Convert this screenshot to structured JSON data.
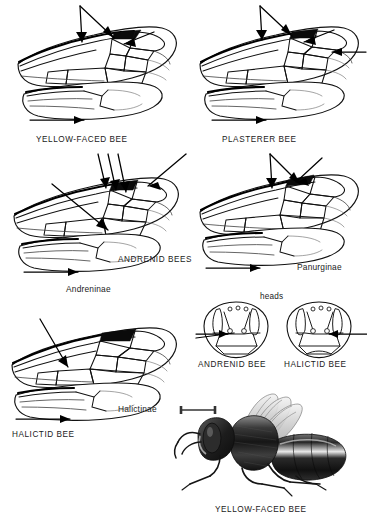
{
  "plate": {
    "title_caption": "YELLOW-FACED BEE",
    "background_color": "#ffffff",
    "ink_color": "#111111",
    "figure_type": "entomological-plate-bee-wing-venation"
  },
  "panels": [
    {
      "id": "yellow-faced-bee",
      "label": "YELLOW-FACED BEE",
      "label_style": "caps",
      "position": "top-left",
      "wings": [
        "forewing",
        "hindwing"
      ],
      "arrows": 3
    },
    {
      "id": "plasterer-bee",
      "label": "PLASTERER BEE",
      "label_style": "caps",
      "position": "top-right",
      "wings": [
        "forewing",
        "hindwing"
      ],
      "arrows": 4
    },
    {
      "id": "andrenid-bees-andreninae",
      "label": "ANDRENID BEES",
      "sublabel": "Andreninae",
      "label_style": "caps",
      "sublabel_style": "italic",
      "position": "middle-left",
      "wings": [
        "forewing",
        "hindwing"
      ],
      "arrows": 3
    },
    {
      "id": "panurginae",
      "label": "Panurginae",
      "label_style": "italic",
      "position": "middle-right",
      "wings": [
        "forewing",
        "hindwing"
      ],
      "arrows": 3
    },
    {
      "id": "halictid-bee-halictinae",
      "label": "HALICTID BEE",
      "sublabel": "Halictinae",
      "label_style": "caps",
      "sublabel_style": "italic",
      "position": "bottom-left",
      "wings": [
        "forewing",
        "hindwing"
      ],
      "arrows": 2
    }
  ],
  "heads": {
    "group_label": "heads",
    "items": [
      {
        "id": "andrenid-head",
        "label": "ANDRENID BEE"
      },
      {
        "id": "halictid-head",
        "label": "HALICTID BEE"
      }
    ]
  },
  "habitus": {
    "label": "YELLOW-FACED BEE",
    "scale_bar": true,
    "style": "engraving"
  }
}
